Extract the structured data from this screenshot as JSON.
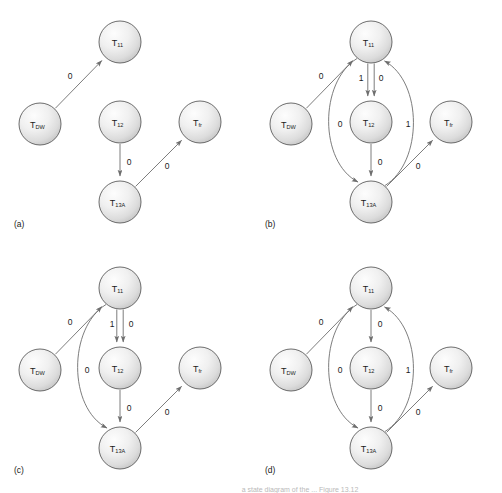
{
  "figure": {
    "width": 502,
    "height": 493,
    "background": "#ffffff",
    "node_stroke": "#5c5c5c",
    "edge_stroke": "#6e6e6e",
    "text_color": "#1a1a1a",
    "node_radius": 21,
    "caption_partial": "a state diagram of the ... Figure 13.12"
  },
  "nodes": {
    "t11": {
      "base": "T",
      "sub": "11",
      "name": "T11"
    },
    "t12": {
      "base": "T",
      "sub": "12",
      "name": "T12"
    },
    "t13a": {
      "base": "T",
      "sub": "13A",
      "name": "T13A"
    },
    "tdw": {
      "base": "T",
      "sub": "DW",
      "name": "TDW"
    },
    "tfr": {
      "base": "T",
      "sub": "fr",
      "name": "Tfr"
    }
  },
  "panels": [
    {
      "id": "a",
      "label": "(a)",
      "origin": {
        "x": 0,
        "y": 0
      },
      "node_positions": {
        "t11": {
          "x": 120,
          "y": 42
        },
        "t12": {
          "x": 120,
          "y": 122
        },
        "t13a": {
          "x": 120,
          "y": 202
        },
        "tdw": {
          "x": 40,
          "y": 124
        },
        "tfr": {
          "x": 200,
          "y": 122
        }
      },
      "edges": [
        {
          "from": "tdw",
          "to": "t11",
          "label": "0",
          "label_pos": {
            "x": 70,
            "y": 76
          },
          "kind": "straight"
        },
        {
          "from": "t12",
          "to": "t13a",
          "label": "0",
          "label_pos": {
            "x": 129,
            "y": 162
          },
          "kind": "straight"
        },
        {
          "from": "t13a",
          "to": "tfr",
          "label": "0",
          "label_pos": {
            "x": 167,
            "y": 166
          },
          "kind": "straight"
        }
      ]
    },
    {
      "id": "b",
      "label": "(b)",
      "origin": {
        "x": 251,
        "y": 0
      },
      "node_positions": {
        "t11": {
          "x": 120,
          "y": 42
        },
        "t12": {
          "x": 120,
          "y": 122
        },
        "t13a": {
          "x": 120,
          "y": 202
        },
        "tdw": {
          "x": 40,
          "y": 124
        },
        "tfr": {
          "x": 200,
          "y": 122
        }
      },
      "edges": [
        {
          "from": "tdw",
          "to": "t11",
          "label": "0",
          "label_pos": {
            "x": 70,
            "y": 76
          },
          "kind": "straight"
        },
        {
          "from": "t11",
          "to": "t12",
          "label": "1",
          "label_pos": {
            "x": 110,
            "y": 78
          },
          "kind": "parallel-left"
        },
        {
          "from": "t11",
          "to": "t12",
          "label": "0",
          "label_pos": {
            "x": 130,
            "y": 78
          },
          "kind": "parallel-right"
        },
        {
          "from": "t12",
          "to": "t13a",
          "label": "0",
          "label_pos": {
            "x": 129,
            "y": 162
          },
          "kind": "straight"
        },
        {
          "from": "t11",
          "to": "t13a",
          "label": "0",
          "label_pos": {
            "x": 89,
            "y": 124
          },
          "kind": "curve-left"
        },
        {
          "from": "t13a",
          "to": "t11",
          "label": "1",
          "label_pos": {
            "x": 157,
            "y": 124
          },
          "kind": "curve-right"
        },
        {
          "from": "t13a",
          "to": "tfr",
          "label": "0",
          "label_pos": {
            "x": 167,
            "y": 166
          },
          "kind": "straight"
        }
      ]
    },
    {
      "id": "c",
      "label": "(c)",
      "origin": {
        "x": 0,
        "y": 246
      },
      "node_positions": {
        "t11": {
          "x": 120,
          "y": 42
        },
        "t12": {
          "x": 120,
          "y": 122
        },
        "t13a": {
          "x": 120,
          "y": 202
        },
        "tdw": {
          "x": 40,
          "y": 124
        },
        "tfr": {
          "x": 200,
          "y": 122
        }
      },
      "edges": [
        {
          "from": "tdw",
          "to": "t11",
          "label": "0",
          "label_pos": {
            "x": 70,
            "y": 76
          },
          "kind": "straight"
        },
        {
          "from": "t11",
          "to": "t12",
          "label": "1",
          "label_pos": {
            "x": 112,
            "y": 78
          },
          "kind": "parallel-left"
        },
        {
          "from": "t11",
          "to": "t12",
          "label": "0",
          "label_pos": {
            "x": 131,
            "y": 78
          },
          "kind": "parallel-right"
        },
        {
          "from": "t12",
          "to": "t13a",
          "label": "0",
          "label_pos": {
            "x": 129,
            "y": 162
          },
          "kind": "straight"
        },
        {
          "from": "t11",
          "to": "t13a",
          "label": "0",
          "label_pos": {
            "x": 87,
            "y": 124
          },
          "kind": "curve-left"
        },
        {
          "from": "t13a",
          "to": "tfr",
          "label": "0",
          "label_pos": {
            "x": 167,
            "y": 166
          },
          "kind": "straight"
        }
      ]
    },
    {
      "id": "d",
      "label": "(d)",
      "origin": {
        "x": 251,
        "y": 246
      },
      "node_positions": {
        "t11": {
          "x": 120,
          "y": 42
        },
        "t12": {
          "x": 120,
          "y": 122
        },
        "t13a": {
          "x": 120,
          "y": 202
        },
        "tdw": {
          "x": 40,
          "y": 124
        },
        "tfr": {
          "x": 200,
          "y": 122
        }
      },
      "edges": [
        {
          "from": "tdw",
          "to": "t11",
          "label": "0",
          "label_pos": {
            "x": 70,
            "y": 76
          },
          "kind": "straight"
        },
        {
          "from": "t11",
          "to": "t12",
          "label": "0",
          "label_pos": {
            "x": 129,
            "y": 78
          },
          "kind": "single-vertical"
        },
        {
          "from": "t12",
          "to": "t13a",
          "label": "0",
          "label_pos": {
            "x": 129,
            "y": 162
          },
          "kind": "straight"
        },
        {
          "from": "t11",
          "to": "t13a",
          "label": "0",
          "label_pos": {
            "x": 89,
            "y": 124
          },
          "kind": "curve-left"
        },
        {
          "from": "t13a",
          "to": "t11",
          "label": "1",
          "label_pos": {
            "x": 157,
            "y": 124
          },
          "kind": "curve-right"
        },
        {
          "from": "t13a",
          "to": "tfr",
          "label": "0",
          "label_pos": {
            "x": 167,
            "y": 166
          },
          "kind": "straight"
        }
      ]
    }
  ],
  "panel_label_pos": {
    "x": 14,
    "y": 224
  }
}
